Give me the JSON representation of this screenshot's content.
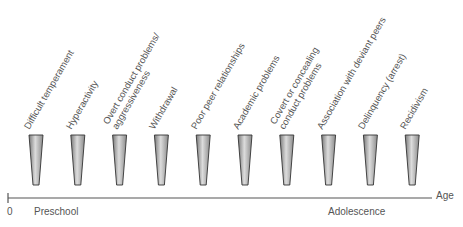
{
  "diagram": {
    "factors": [
      {
        "label": [
          "Difficult temperament"
        ]
      },
      {
        "label": [
          "Hyperactivity"
        ]
      },
      {
        "label": [
          "Overt conduct problems/",
          "aggressiveness"
        ]
      },
      {
        "label": [
          "Withdrawal"
        ]
      },
      {
        "label": [
          "Poor peer relationships"
        ]
      },
      {
        "label": [
          "Academic problems"
        ]
      },
      {
        "label": [
          "Covert or concealing",
          "conduct problems"
        ]
      },
      {
        "label": [
          "Association with deviant peers"
        ]
      },
      {
        "label": [
          "Delinquency (arrest)"
        ]
      },
      {
        "label": [
          "Recidivism"
        ]
      }
    ],
    "axis": {
      "origin_label": "0",
      "axis_title": "Age",
      "period_start": "Preschool",
      "period_end": "Adolescence"
    },
    "colors": {
      "cone_dark": "#6e6e6e",
      "cone_light": "#d8d8d8",
      "axis": "#555555",
      "text": "#555555"
    }
  }
}
